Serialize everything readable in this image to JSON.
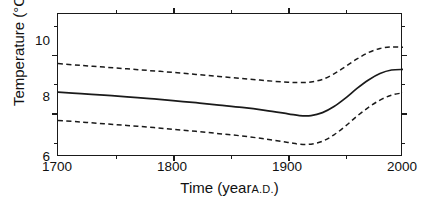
{
  "figure": {
    "background_color": "#ffffff",
    "line_color": "#1a1a1a"
  },
  "axes": {
    "y_title_main": "Temperature",
    "y_title_unit": "(°C)",
    "x_title_main": "Time (year",
    "x_title_smallcaps": "A.D.",
    "x_title_close": ")",
    "y_ticks": [
      "10",
      "8",
      "6"
    ],
    "y_tick_values": [
      10,
      8,
      6
    ],
    "y_minor_values": [
      11,
      9,
      7
    ],
    "x_ticks": [
      "1700",
      "1800",
      "1900",
      "2000"
    ],
    "x_tick_values": [
      1700,
      1800,
      1900,
      2000
    ],
    "x_minor_values": [
      1750,
      1850,
      1950
    ],
    "xlim": [
      1700,
      2000
    ],
    "ylim": [
      6.0,
      10.9
    ],
    "grid": false
  },
  "chart_data": {
    "type": "line",
    "title": "",
    "subtitle": "",
    "xlabel": "Time (year A.D.)",
    "ylabel": "Temperature (°C)",
    "xlim": [
      1700,
      2000
    ],
    "ylim": [
      6.0,
      10.9
    ],
    "grid": false,
    "legend": "none",
    "x": [
      1700,
      1720,
      1740,
      1760,
      1780,
      1800,
      1820,
      1840,
      1860,
      1880,
      1900,
      1910,
      1920,
      1930,
      1940,
      1950,
      1960,
      1970,
      1980,
      1990,
      2000
    ],
    "series": [
      {
        "name": "Upper uncertainty bound",
        "style": "dashed",
        "color": "#1a1a1a",
        "values": [
          9.2,
          9.14,
          9.08,
          9.02,
          8.96,
          8.9,
          8.83,
          8.76,
          8.69,
          8.62,
          8.56,
          8.55,
          8.57,
          8.66,
          8.85,
          9.1,
          9.36,
          9.58,
          9.72,
          9.77,
          9.76
        ]
      },
      {
        "name": "Reconstructed temperature",
        "style": "solid",
        "color": "#1a1a1a",
        "values": [
          8.22,
          8.17,
          8.12,
          8.06,
          8.0,
          7.93,
          7.86,
          7.78,
          7.7,
          7.6,
          7.48,
          7.42,
          7.42,
          7.52,
          7.73,
          8.02,
          8.35,
          8.64,
          8.86,
          8.98,
          9.0
        ]
      },
      {
        "name": "Lower uncertainty bound",
        "style": "dashed",
        "color": "#1a1a1a",
        "values": [
          7.25,
          7.2,
          7.14,
          7.08,
          7.02,
          6.95,
          6.88,
          6.8,
          6.72,
          6.62,
          6.5,
          6.44,
          6.44,
          6.54,
          6.76,
          7.06,
          7.4,
          7.7,
          7.95,
          8.12,
          8.2
        ]
      }
    ]
  }
}
